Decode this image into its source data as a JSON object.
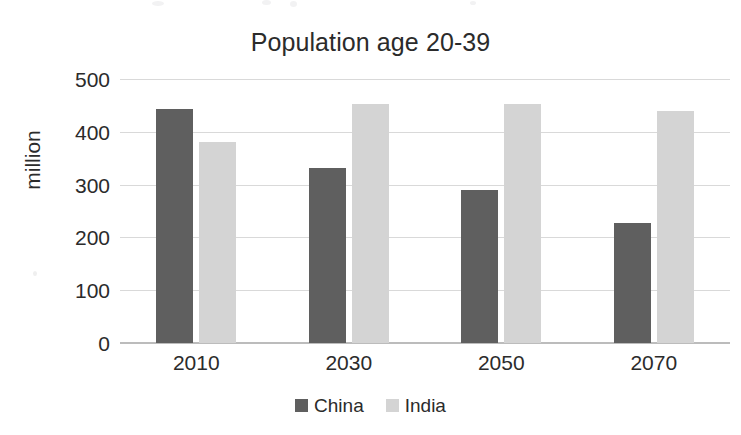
{
  "chart_data": {
    "type": "bar",
    "title": "Population age 20-39",
    "xlabel": "",
    "ylabel": "million",
    "categories": [
      "2010",
      "2030",
      "2050",
      "2070"
    ],
    "series": [
      {
        "name": "China",
        "color": "#5f5f5f",
        "values": [
          443,
          332,
          290,
          227
        ]
      },
      {
        "name": "India",
        "color": "#d4d4d4",
        "values": [
          380,
          453,
          453,
          440
        ]
      }
    ],
    "ylim": [
      0,
      500
    ],
    "yticks": [
      0,
      100,
      200,
      300,
      400,
      500
    ],
    "ytick_labels": [
      "0",
      "100",
      "200",
      "300",
      "400",
      "500"
    ],
    "grid": true,
    "legend_position": "bottom"
  },
  "legend": {
    "items": [
      {
        "label": "China",
        "swatch": "china"
      },
      {
        "label": "India",
        "swatch": "india"
      }
    ]
  },
  "colors": {
    "china": "#5f5f5f",
    "india": "#d4d4d4",
    "gridline": "#d9d9d9",
    "axis": "#bcbcbc",
    "text": "#2b2b2b",
    "background": "#ffffff"
  }
}
